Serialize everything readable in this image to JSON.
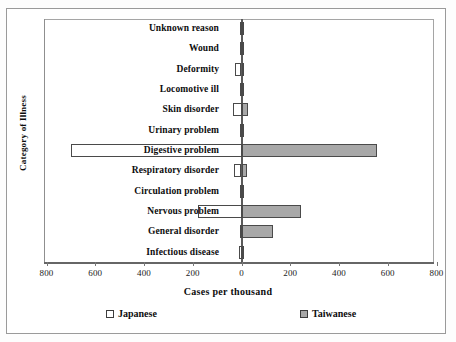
{
  "chart_data": {
    "type": "bar",
    "orientation": "horizontal",
    "style": "paired-opposing-bars",
    "title": "",
    "xlabel": "Cases per thousand",
    "ylabel": "Category of Illness",
    "xlim": [
      -800,
      800
    ],
    "xticks": [
      -800,
      -600,
      -400,
      -200,
      0,
      200,
      400,
      600,
      800
    ],
    "xtick_labels": [
      "800",
      "600",
      "400",
      "200",
      "0",
      "200",
      "400",
      "600",
      "800"
    ],
    "grid": false,
    "legend_position": "bottom",
    "note_left_axis": "Japanese values plotted to the left of zero",
    "note_right_axis": "Taiwanese values plotted to the right of zero",
    "categories": [
      "Unknown reason",
      "Wound",
      "Deformity",
      "Locomotive ill",
      "Skin disorder",
      "Urinary problem",
      "Digestive problem",
      "Respiratory disorder",
      "Circulation problem",
      "Nervous problem",
      "General disorder",
      "Infectious disease"
    ],
    "series": [
      {
        "name": "Japanese",
        "color": "#ffffff",
        "side": "left",
        "values": [
          2,
          3,
          28,
          4,
          35,
          5,
          700,
          32,
          6,
          180,
          8,
          10
        ]
      },
      {
        "name": "Taiwanese",
        "color": "#a8a8a8",
        "side": "right",
        "values": [
          3,
          4,
          5,
          6,
          25,
          5,
          555,
          22,
          6,
          245,
          130,
          12
        ]
      }
    ]
  },
  "legend": {
    "items": [
      {
        "label": "Japanese",
        "swatch": "white-square-swatch"
      },
      {
        "label": "Taiwanese",
        "swatch": "gray-square-swatch"
      }
    ]
  }
}
